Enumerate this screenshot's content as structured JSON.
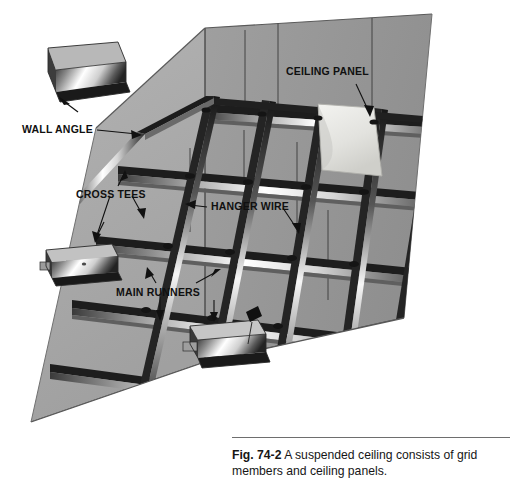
{
  "figure": {
    "type": "technical-illustration",
    "caption": {
      "figure_number": "Fig. 74-2",
      "text": "A suspended ceiling consists of grid members and ceiling panels."
    }
  },
  "callouts": [
    {
      "id": "ceiling-panel",
      "label": "CEILING PANEL",
      "x": 286,
      "y": 71,
      "leader": [
        [
          356,
          84
        ],
        [
          369,
          112
        ]
      ]
    },
    {
      "id": "wall-angle",
      "label": "WALL ANGLE",
      "x": 22,
      "y": 124,
      "leader": [
        [
          97,
          130
        ],
        [
          137,
          134
        ]
      ]
    },
    {
      "id": "cross-tees",
      "label": "CROSS TEES",
      "x": 76,
      "y": 189,
      "leader": [
        [
          118,
          186
        ],
        [
          122,
          176
        ]
      ]
    },
    {
      "id": "hanger-wire",
      "label": "HANGER WIRE",
      "x": 211,
      "y": 203,
      "leader": [
        [
          283,
          207
        ],
        [
          297,
          228
        ]
      ]
    },
    {
      "id": "main-runners",
      "label": "MAIN RUNNERS",
      "x": 118,
      "y": 287,
      "leader": [
        [
          156,
          283
        ],
        [
          148,
          272
        ]
      ]
    }
  ],
  "colors": {
    "wall_left": "#a8a8a8",
    "wall_right": "#9a9a9a",
    "wall_top_left": "#b4b4b4",
    "wall_edge": "#4a4a4a",
    "floor": "#ffffff",
    "grid_dark": "#1d1d1d",
    "grid_highlight": "#f2f2f2",
    "grid_mid": "#8d8d8d",
    "panel_face": "#e3e3e0",
    "panel_edge": "#b9b9b5",
    "hanger_wire": "#3a3a3a",
    "label_text": "#101010",
    "caption_text": "#161616",
    "caption_rule": "#6e6e6e"
  },
  "geometry": {
    "walls": {
      "corner_top": [
        205,
        28
      ],
      "corner_bottom": [
        205,
        362
      ],
      "left_outer_top": [
        96,
        128
      ],
      "left_outer_bottom": [
        31,
        422
      ],
      "right_outer_top": [
        432,
        14
      ],
      "right_outer_bottom": [
        404,
        318
      ]
    },
    "grid": {
      "main_runner_count": 5,
      "cross_tee_count": 5,
      "hanger_wire_count": 7,
      "panel_openings": 16
    }
  },
  "detail_insets": [
    {
      "id": "wall-angle-profile",
      "name": "wall angle L-profile",
      "x": 42,
      "y": 44,
      "w": 82,
      "h": 52
    },
    {
      "id": "cross-tee-profile",
      "name": "cross tee T-profile",
      "x": 40,
      "y": 242,
      "w": 82,
      "h": 44
    },
    {
      "id": "main-runner-profile",
      "name": "main runner T-profile",
      "x": 186,
      "y": 318,
      "w": 82,
      "h": 48
    }
  ]
}
